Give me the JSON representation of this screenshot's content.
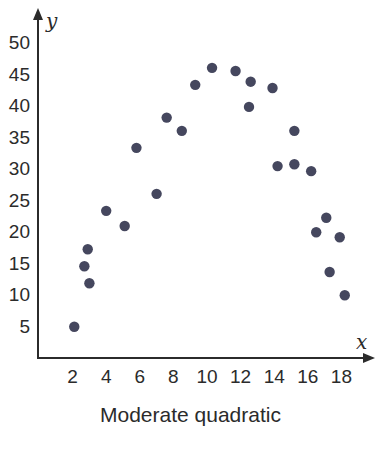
{
  "caption": "Moderate quadratic",
  "chart_data": {
    "type": "scatter",
    "title": "Moderate quadratic",
    "xlabel": "x",
    "ylabel": "y",
    "xticks": [
      2,
      4,
      6,
      8,
      10,
      12,
      14,
      16,
      18
    ],
    "yticks": [
      5,
      10,
      15,
      20,
      25,
      30,
      35,
      40,
      45,
      50
    ],
    "xlim": [
      0,
      19.5
    ],
    "ylim": [
      0,
      52
    ],
    "grid": false,
    "legend": null,
    "marker_color": "#45475e",
    "points": [
      {
        "x": 2.1,
        "y": 4.8
      },
      {
        "x": 2.7,
        "y": 14.4
      },
      {
        "x": 2.9,
        "y": 17.1
      },
      {
        "x": 3.0,
        "y": 11.7
      },
      {
        "x": 4.0,
        "y": 23.2
      },
      {
        "x": 5.1,
        "y": 20.8
      },
      {
        "x": 5.8,
        "y": 33.2
      },
      {
        "x": 7.0,
        "y": 25.9
      },
      {
        "x": 7.6,
        "y": 38.0
      },
      {
        "x": 8.5,
        "y": 35.9
      },
      {
        "x": 9.3,
        "y": 43.2
      },
      {
        "x": 10.3,
        "y": 45.9
      },
      {
        "x": 11.7,
        "y": 45.4
      },
      {
        "x": 12.5,
        "y": 39.7
      },
      {
        "x": 12.6,
        "y": 43.7
      },
      {
        "x": 13.9,
        "y": 42.7
      },
      {
        "x": 14.2,
        "y": 30.3
      },
      {
        "x": 15.2,
        "y": 35.9
      },
      {
        "x": 15.2,
        "y": 30.6
      },
      {
        "x": 16.2,
        "y": 29.5
      },
      {
        "x": 16.5,
        "y": 19.8
      },
      {
        "x": 17.1,
        "y": 22.1
      },
      {
        "x": 17.3,
        "y": 13.5
      },
      {
        "x": 17.9,
        "y": 19.0
      },
      {
        "x": 18.2,
        "y": 9.8
      }
    ]
  }
}
